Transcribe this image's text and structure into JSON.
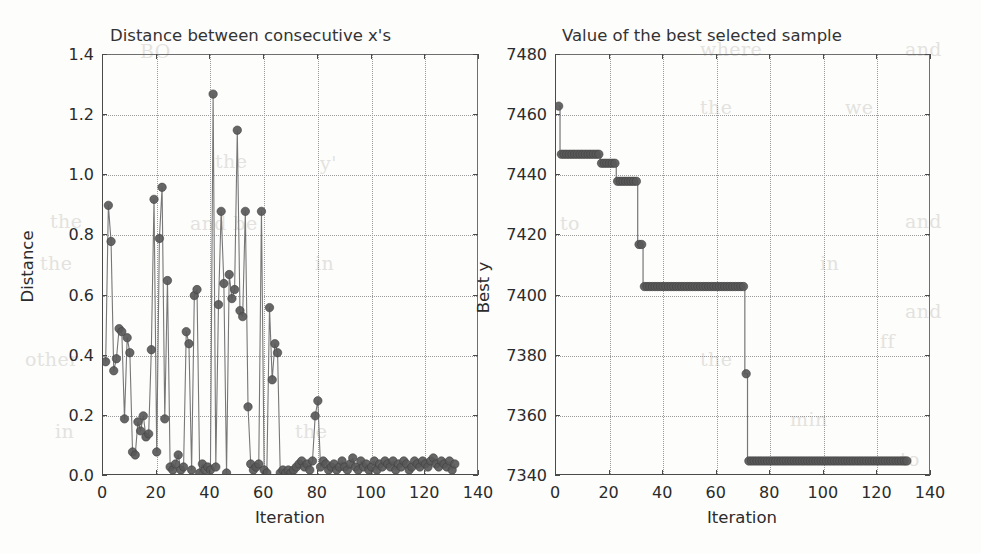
{
  "figure": {
    "background_color": "#fdfdfc",
    "marker_color": "#595959",
    "line_color": "#777777",
    "grid_color": "#9a9a9a",
    "axis_color": "#4a4a4a"
  },
  "bleed_text": [
    {
      "t": "BO",
      "x": 140,
      "y": 40
    },
    {
      "t": "n",
      "x": 520,
      "y": 40
    },
    {
      "t": "where",
      "x": 700,
      "y": 38
    },
    {
      "t": "and",
      "x": 905,
      "y": 38
    },
    {
      "t": "we",
      "x": 845,
      "y": 96
    },
    {
      "t": "the",
      "x": 700,
      "y": 96
    },
    {
      "t": "the",
      "x": 215,
      "y": 150
    },
    {
      "t": "y'",
      "x": 320,
      "y": 152
    },
    {
      "t": "the",
      "x": 50,
      "y": 210
    },
    {
      "t": "and be",
      "x": 190,
      "y": 212
    },
    {
      "t": "to",
      "x": 560,
      "y": 212
    },
    {
      "t": "and",
      "x": 905,
      "y": 210
    },
    {
      "t": "the",
      "x": 40,
      "y": 252
    },
    {
      "t": "in",
      "x": 315,
      "y": 252
    },
    {
      "t": "in",
      "x": 820,
      "y": 252
    },
    {
      "t": "and",
      "x": 905,
      "y": 300
    },
    {
      "t": "ff",
      "x": 880,
      "y": 330
    },
    {
      "t": "other",
      "x": 25,
      "y": 348
    },
    {
      "t": "the",
      "x": 700,
      "y": 348
    },
    {
      "t": "min",
      "x": 790,
      "y": 408
    },
    {
      "t": "in",
      "x": 55,
      "y": 420
    },
    {
      "t": "the",
      "x": 295,
      "y": 420
    },
    {
      "t": "to",
      "x": 900,
      "y": 448
    }
  ],
  "panels": [
    {
      "name": "distance-panel",
      "title": "Distance between consecutive x's",
      "xlabel": "Iteration",
      "ylabel": "Distance",
      "xticks": [
        "0",
        "20",
        "40",
        "60",
        "80",
        "100",
        "120",
        "140"
      ],
      "yticks": [
        "0.0",
        "0.2",
        "0.4",
        "0.6",
        "0.8",
        "1.0",
        "1.2",
        "1.4"
      ]
    },
    {
      "name": "best-value-panel",
      "title": "Value of the best selected sample",
      "xlabel": "Iteration",
      "ylabel": "Best y",
      "xticks": [
        "0",
        "20",
        "40",
        "60",
        "80",
        "100",
        "120",
        "140"
      ],
      "yticks": [
        "7340",
        "7360",
        "7380",
        "7400",
        "7420",
        "7440",
        "7460",
        "7480"
      ]
    }
  ],
  "chart_data": [
    {
      "type": "line",
      "name": "distance-between-consecutive-x",
      "title": "Distance between consecutive x's",
      "xlabel": "Iteration",
      "ylabel": "Distance",
      "xlim": [
        0,
        140
      ],
      "ylim": [
        0.0,
        1.4
      ],
      "xticks": [
        0,
        20,
        40,
        60,
        80,
        100,
        120,
        140
      ],
      "yticks": [
        0.0,
        0.2,
        0.4,
        0.6,
        0.8,
        1.0,
        1.2,
        1.4
      ],
      "grid": true,
      "legend": null,
      "marker": "circle",
      "x": [
        1,
        2,
        3,
        4,
        5,
        6,
        7,
        8,
        9,
        10,
        11,
        12,
        13,
        14,
        15,
        16,
        17,
        18,
        19,
        20,
        21,
        22,
        23,
        24,
        25,
        26,
        27,
        28,
        29,
        30,
        31,
        32,
        33,
        34,
        35,
        36,
        37,
        38,
        39,
        40,
        41,
        42,
        43,
        44,
        45,
        46,
        47,
        48,
        49,
        50,
        51,
        52,
        53,
        54,
        55,
        56,
        57,
        58,
        59,
        60,
        61,
        62,
        63,
        64,
        65,
        66,
        67,
        68,
        69,
        70,
        71,
        72,
        73,
        74,
        75,
        76,
        77,
        78,
        79,
        80,
        81,
        82,
        83,
        84,
        85,
        86,
        87,
        88,
        89,
        90,
        91,
        92,
        93,
        94,
        95,
        96,
        97,
        98,
        99,
        100,
        101,
        102,
        103,
        104,
        105,
        106,
        107,
        108,
        109,
        110,
        111,
        112,
        113,
        114,
        115,
        116,
        117,
        118,
        119,
        120,
        121,
        122,
        123,
        124,
        125,
        126,
        127,
        128,
        129,
        130,
        131
      ],
      "y": [
        0.38,
        0.9,
        0.78,
        0.35,
        0.39,
        0.49,
        0.48,
        0.19,
        0.46,
        0.41,
        0.08,
        0.07,
        0.18,
        0.15,
        0.2,
        0.13,
        0.14,
        0.42,
        0.92,
        0.08,
        0.79,
        0.96,
        0.19,
        0.65,
        0.03,
        0.02,
        0.04,
        0.07,
        0.02,
        0.03,
        0.48,
        0.44,
        0.02,
        0.6,
        0.62,
        0.01,
        0.04,
        0.02,
        0.03,
        0.02,
        1.27,
        0.03,
        0.57,
        0.88,
        0.64,
        0.01,
        0.67,
        0.59,
        0.62,
        1.15,
        0.55,
        0.53,
        0.88,
        0.23,
        0.04,
        0.02,
        0.03,
        0.04,
        0.88,
        0.02,
        0.01,
        0.56,
        0.32,
        0.44,
        0.41,
        0.01,
        0.02,
        0.01,
        0.02,
        0.01,
        0.02,
        0.03,
        0.04,
        0.05,
        0.03,
        0.04,
        0.02,
        0.05,
        0.2,
        0.25,
        0.03,
        0.05,
        0.04,
        0.02,
        0.03,
        0.04,
        0.02,
        0.03,
        0.05,
        0.03,
        0.02,
        0.04,
        0.06,
        0.03,
        0.02,
        0.05,
        0.03,
        0.04,
        0.02,
        0.03,
        0.05,
        0.02,
        0.04,
        0.03,
        0.05,
        0.04,
        0.03,
        0.05,
        0.02,
        0.04,
        0.03,
        0.05,
        0.04,
        0.02,
        0.03,
        0.05,
        0.04,
        0.03,
        0.05,
        0.04,
        0.03,
        0.05,
        0.06,
        0.04,
        0.03,
        0.05,
        0.04,
        0.03,
        0.05,
        0.02,
        0.04
      ]
    },
    {
      "type": "line",
      "name": "best-selected-sample-value",
      "title": "Value of the best selected sample",
      "xlabel": "Iteration",
      "ylabel": "Best y",
      "xlim": [
        0,
        140
      ],
      "ylim": [
        7340,
        7480
      ],
      "xticks": [
        0,
        20,
        40,
        60,
        80,
        100,
        120,
        140
      ],
      "yticks": [
        7340,
        7360,
        7380,
        7400,
        7420,
        7440,
        7460,
        7480
      ],
      "grid": true,
      "legend": null,
      "marker": "circle",
      "description": "Monotonically decreasing step function of the best objective value found so far.",
      "steps": [
        {
          "x_start": 1,
          "x_end": 1,
          "value": 7463
        },
        {
          "x_start": 2,
          "x_end": 16,
          "value": 7447
        },
        {
          "x_start": 17,
          "x_end": 22,
          "value": 7444
        },
        {
          "x_start": 23,
          "x_end": 30,
          "value": 7438
        },
        {
          "x_start": 31,
          "x_end": 32,
          "value": 7417
        },
        {
          "x_start": 33,
          "x_end": 70,
          "value": 7403
        },
        {
          "x_start": 71,
          "x_end": 71,
          "value": 7374
        },
        {
          "x_start": 72,
          "x_end": 131,
          "value": 7345
        }
      ]
    }
  ]
}
